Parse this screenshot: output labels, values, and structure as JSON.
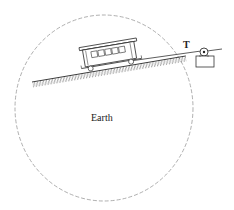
{
  "diagram": {
    "labels": {
      "tension": "T",
      "body": "Earth"
    },
    "elements": {
      "earth_circle": {
        "style": "dashed",
        "color": "#9a9a9a"
      },
      "ground": {
        "style": "hatched incline"
      },
      "car": {
        "type": "trolley car"
      },
      "cable": {
        "type": "rope"
      },
      "pulley": {
        "type": "pulley on block"
      }
    },
    "colors": {
      "line": "#333333",
      "dashed_circle": "#9a9a9a"
    }
  }
}
